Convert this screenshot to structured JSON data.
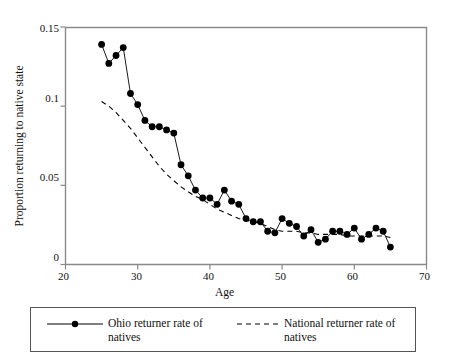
{
  "chart_data": {
    "type": "line",
    "title": "",
    "xlabel": "Age",
    "ylabel": "Proportion returning to native state",
    "xlim": [
      20,
      70
    ],
    "ylim": [
      0,
      0.15
    ],
    "xticks": [
      20,
      30,
      40,
      50,
      60,
      70
    ],
    "xtick_labels": [
      "20",
      "30",
      "40",
      "50",
      "60",
      "70"
    ],
    "yticks": [
      0,
      0.05,
      0.1,
      0.15
    ],
    "ytick_labels": [
      "0",
      "0.05",
      "0.1",
      "0.15"
    ],
    "grid": false,
    "legend_position": "below-plot",
    "series": [
      {
        "name": "Ohio returner rate of natives",
        "style": "solid-with-markers",
        "marker": "filled-circle",
        "color": "#000000",
        "x": [
          25,
          26,
          27,
          28,
          29,
          30,
          31,
          32,
          33,
          34,
          35,
          36,
          37,
          38,
          39,
          40,
          41,
          42,
          43,
          44,
          45,
          46,
          47,
          48,
          49,
          50,
          51,
          52,
          53,
          54,
          55,
          56,
          57,
          58,
          59,
          60,
          61,
          62,
          63,
          64,
          65
        ],
        "values": [
          0.139,
          0.127,
          0.132,
          0.137,
          0.108,
          0.101,
          0.091,
          0.087,
          0.087,
          0.085,
          0.083,
          0.063,
          0.056,
          0.047,
          0.042,
          0.042,
          0.038,
          0.047,
          0.04,
          0.038,
          0.029,
          0.027,
          0.027,
          0.021,
          0.02,
          0.029,
          0.026,
          0.024,
          0.018,
          0.022,
          0.014,
          0.016,
          0.021,
          0.021,
          0.019,
          0.023,
          0.016,
          0.019,
          0.023,
          0.021,
          0.011
        ]
      },
      {
        "name": "National returner rate of natives",
        "style": "dashed",
        "marker": "none",
        "color": "#000000",
        "x": [
          25,
          26,
          27,
          28,
          29,
          30,
          31,
          32,
          33,
          34,
          35,
          36,
          37,
          38,
          39,
          40,
          41,
          42,
          43,
          44,
          45,
          46,
          47,
          48,
          49,
          50,
          51,
          52,
          53,
          54,
          55,
          56,
          57,
          58,
          59,
          60,
          61,
          62,
          63,
          64,
          65
        ],
        "values": [
          0.103,
          0.1,
          0.096,
          0.091,
          0.086,
          0.08,
          0.074,
          0.068,
          0.062,
          0.057,
          0.053,
          0.049,
          0.046,
          0.043,
          0.041,
          0.038,
          0.035,
          0.033,
          0.031,
          0.029,
          0.028,
          0.027,
          0.026,
          0.024,
          0.022,
          0.021,
          0.021,
          0.021,
          0.02,
          0.02,
          0.019,
          0.019,
          0.019,
          0.019,
          0.018,
          0.018,
          0.018,
          0.018,
          0.018,
          0.018,
          0.017
        ]
      }
    ]
  },
  "legend": {
    "entries": [
      {
        "label": "Ohio returner rate of natives",
        "style": "solid-with-marker"
      },
      {
        "label": "National returner rate of natives",
        "style": "dashed"
      }
    ]
  },
  "colors": {
    "ink": "#000000",
    "frame": "#7a7a7a",
    "background": "#ffffff"
  }
}
